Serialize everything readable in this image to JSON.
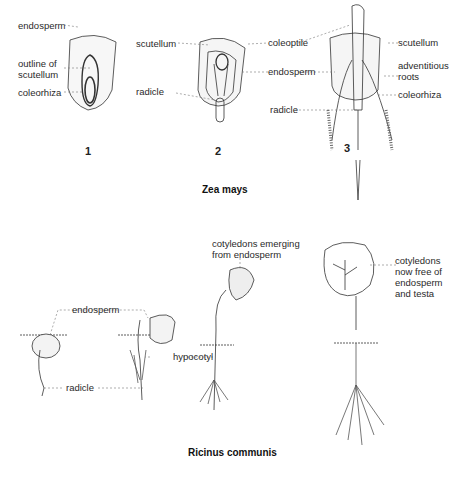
{
  "zea_mays": {
    "caption": "Zea mays",
    "stage1": {
      "number": "1",
      "labels": {
        "endosperm": "endosperm",
        "outline_of_scutellum": "outline of\nscutellum",
        "coleorhiza": "coleorhiza"
      }
    },
    "stage2": {
      "number": "2",
      "labels": {
        "scutellum": "scutellum",
        "radicle": "radicle",
        "coleoptile": "coleoptile",
        "endosperm": "endosperm"
      }
    },
    "stage3": {
      "number": "3",
      "labels": {
        "radicle": "radicle",
        "scutellum": "scutellum",
        "adventitious_roots": "adventitious\nroots",
        "coleorhiza": "coleorhiza"
      }
    }
  },
  "ricinus_communis": {
    "caption": "Ricinus communis",
    "labels": {
      "endosperm": "endosperm",
      "radicle": "radicle",
      "hypocotyl": "hypocotyl",
      "cotyledons_emerging": "cotyledons emerging\nfrom endosperm",
      "cotyledons_free": "cotyledons\nnow free of\nendosperm\nand testa"
    }
  }
}
